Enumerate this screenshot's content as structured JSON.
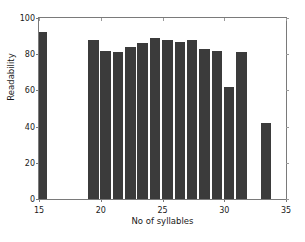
{
  "chart_data": {
    "type": "bar",
    "title": "",
    "xlabel": "No of syllables",
    "ylabel": "Readability",
    "xlim": [
      15,
      35
    ],
    "ylim": [
      0,
      100
    ],
    "xticks": [
      15,
      20,
      25,
      30,
      35
    ],
    "yticks": [
      0,
      20,
      40,
      60,
      80,
      100
    ],
    "xticklabels": [
      "15",
      "20",
      "25",
      "30",
      "35"
    ],
    "yticklabels": [
      "0",
      "20",
      "40",
      "60",
      "80",
      "100"
    ],
    "grid": false,
    "legend": null,
    "bar_color": "#3b3b3b",
    "bar_width": 0.85,
    "x": [
      15.25,
      19.4,
      20.4,
      21.4,
      22.4,
      23.4,
      24.4,
      25.4,
      26.4,
      27.4,
      28.4,
      29.4,
      30.4,
      31.4,
      33.4
    ],
    "values": [
      92,
      88,
      82,
      81,
      84,
      86,
      89,
      88,
      87,
      88,
      83,
      82,
      62,
      81.5,
      42
    ],
    "categories": [
      "15",
      "19",
      "20",
      "21",
      "22",
      "23",
      "24",
      "25",
      "26",
      "27",
      "28",
      "29",
      "30",
      "31",
      "33"
    ]
  }
}
